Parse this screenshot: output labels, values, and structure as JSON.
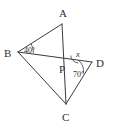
{
  "figure": {
    "type": "geometry-diagram",
    "background_color": "#ffffff",
    "stroke_color": "#3b3b3b",
    "text_color": "#2e2e2e",
    "vertices": [
      {
        "id": "A",
        "label": "A",
        "x": 62,
        "y": 24,
        "label_x": 59,
        "label_y": 17
      },
      {
        "id": "B",
        "label": "B",
        "x": 18,
        "y": 52,
        "label_x": 4,
        "label_y": 57
      },
      {
        "id": "C",
        "label": "C",
        "x": 66,
        "y": 104,
        "label_x": 62,
        "label_y": 121
      },
      {
        "id": "D",
        "label": "D",
        "x": 92,
        "y": 62,
        "label_x": 96,
        "label_y": 67
      },
      {
        "id": "P",
        "label": "P",
        "x": 70,
        "y": 64,
        "label_x": 61,
        "label_y": 72
      }
    ],
    "segments": [
      {
        "id": "BA",
        "from": "B",
        "to": "A"
      },
      {
        "id": "AC",
        "from": "A",
        "to": "C"
      },
      {
        "id": "BD",
        "from": "B",
        "to": "D"
      },
      {
        "id": "BC",
        "from": "B",
        "to": "C"
      },
      {
        "id": "DC",
        "from": "D",
        "to": "C"
      }
    ],
    "angles": [
      {
        "id": "angle-B",
        "vertex": "B",
        "label": "40°",
        "label_x": 24,
        "label_y": 53,
        "value": 40
      },
      {
        "id": "angle-D",
        "vertex": "D",
        "label": "70°",
        "label_x": 73,
        "label_y": 77,
        "value": 70
      },
      {
        "id": "angle-P",
        "vertex": "P",
        "label": "x",
        "label_x": 76,
        "label_y": 57,
        "value": null
      }
    ]
  }
}
